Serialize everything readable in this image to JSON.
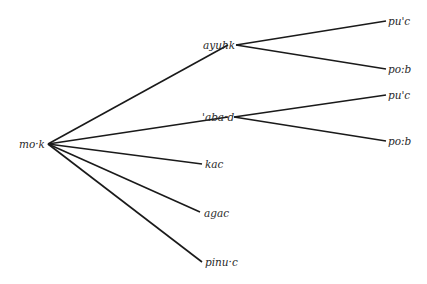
{
  "tree": {
    "root": "mo·k",
    "level1": [
      "ayuhk",
      "'aba·d",
      "kac",
      "agac",
      "pinu·c"
    ],
    "level2": {
      "ayuhk": [
        "pu'c",
        "po:b"
      ],
      "'aba·d": [
        "pu'c",
        "po:b"
      ]
    }
  },
  "labels": {
    "root": "mo·k",
    "ayuhk": "ayuhk",
    "abad": "'aba·d",
    "kac": "kac",
    "agac": "agac",
    "pinuc": "pinu·c",
    "ayuhk_pu": "pu'c",
    "ayuhk_po": "po:b",
    "abad_pu": "pu'c",
    "abad_po": "po:b"
  },
  "colors": {
    "line": "#1a1a1a",
    "text": "#2a2a2a"
  }
}
